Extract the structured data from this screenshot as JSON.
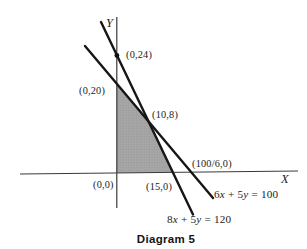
{
  "figure": {
    "caption": "Diagram 5",
    "x_axis_label": "X",
    "y_axis_label": "Y",
    "points": {
      "y_intercept_line_8x5y": "(0,24)",
      "y_intercept_line_6x5y": "(0,20)",
      "intersection": "(10,8)",
      "x_intercept_line_6x5y": "(100/6,0)",
      "origin": "(0,0)",
      "x_intercept_line_8x5y": "(15,0)"
    },
    "equations": [
      {
        "name": "6x + 5y = 100",
        "parts": [
          "6",
          "x",
          " + ",
          "5",
          "y",
          " = ",
          "100"
        ]
      },
      {
        "name": "8x + 5y = 120",
        "parts": [
          "8",
          "x",
          " + ",
          "5",
          "y",
          " = ",
          "120"
        ]
      }
    ],
    "region": {
      "vertices": [
        "(0,0)",
        "(0,20)",
        "(10,8)",
        "(15,0)"
      ],
      "fill": "#a6a6a6"
    },
    "colors": {
      "constraint_line": "#161616",
      "axis": "#3a3a3a",
      "text": "#1c1c1c",
      "background": "#ffffff"
    }
  }
}
